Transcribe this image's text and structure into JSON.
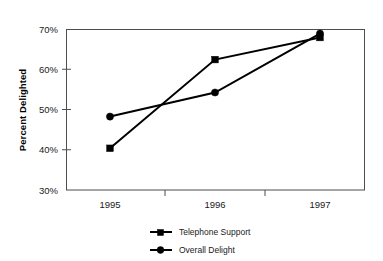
{
  "chart_data": {
    "type": "line",
    "title": "",
    "subtitle": "",
    "xlabel": "",
    "ylabel": "Percent Delighted",
    "categories": [
      "1995",
      "1996",
      "1997"
    ],
    "ylim": [
      30,
      70
    ],
    "ytick_labels": [
      "30%",
      "40%",
      "50%",
      "60%",
      "70%"
    ],
    "ytick_values": [
      30,
      40,
      50,
      60,
      70
    ],
    "grid": false,
    "legend_position": "bottom-center",
    "series": [
      {
        "name": "Telephone Support",
        "marker": "square",
        "values": [
          40.4,
          62.5,
          68.0
        ]
      },
      {
        "name": "Overall Delight",
        "marker": "circle",
        "values": [
          48.3,
          54.3,
          69.0
        ]
      }
    ]
  },
  "axes": {
    "y_title": "Percent Delighted",
    "y_ticks": [
      {
        "label": "70%",
        "value": 70
      },
      {
        "label": "60%",
        "value": 60
      },
      {
        "label": "50%",
        "value": 50
      },
      {
        "label": "40%",
        "value": 40
      },
      {
        "label": "30%",
        "value": 30
      }
    ],
    "x_ticks": [
      {
        "label": "1995"
      },
      {
        "label": "1996"
      },
      {
        "label": "1997"
      }
    ]
  },
  "legend": {
    "entries": [
      {
        "label": "Telephone Support",
        "marker": "square"
      },
      {
        "label": "Overall Delight",
        "marker": "circle"
      }
    ]
  }
}
